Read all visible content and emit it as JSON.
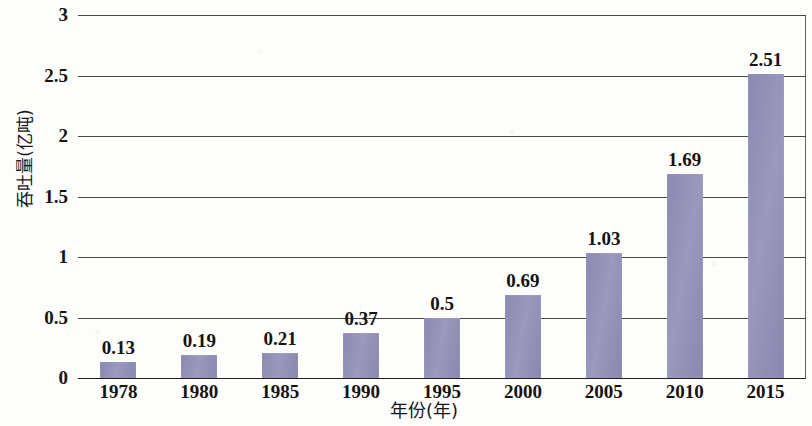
{
  "chart_data": {
    "type": "bar",
    "title": "",
    "xlabel": "年份(年)",
    "ylabel": "吞吐量(亿吨)",
    "categories": [
      "1978",
      "1980",
      "1985",
      "1990",
      "1995",
      "2000",
      "2005",
      "2010",
      "2015"
    ],
    "values": [
      0.13,
      0.19,
      0.21,
      0.37,
      0.5,
      0.69,
      1.03,
      1.69,
      2.51
    ],
    "value_labels": [
      "0.13",
      "0.19",
      "0.21",
      "0.37",
      "0.5",
      "0.69",
      "1.03",
      "1.69",
      "2.51"
    ],
    "ylim": [
      0,
      3
    ],
    "yticks": [
      0,
      0.5,
      1,
      1.5,
      2,
      2.5,
      3
    ],
    "ytick_labels": [
      "0",
      "0.5",
      "1",
      "1.5",
      "2",
      "2.5",
      "3"
    ],
    "grid": true,
    "legend": "none",
    "bar_color": "#8f8cb4",
    "axis_color": "#2f2d2b"
  }
}
